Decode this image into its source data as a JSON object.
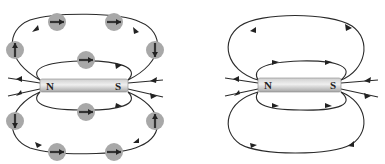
{
  "figure": {
    "left_panel": {
      "description": "Bar magnet with magnetic field lines and compass needles",
      "magnet": {
        "north_label": "N",
        "south_label": "S"
      },
      "compass_count": 12
    },
    "right_panel": {
      "description": "Bar magnet with magnetic field lines only",
      "magnet": {
        "north_label": "N",
        "south_label": "S"
      }
    }
  },
  "colors": {
    "line": "#2a2a2a",
    "compass_fill": "#a8a8a8",
    "magnet_light": "#e4e4e4",
    "magnet_dark": "#a9a9a9"
  }
}
